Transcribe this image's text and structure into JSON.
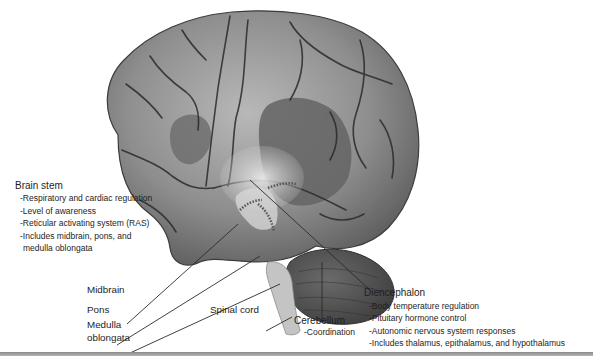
{
  "figure": {
    "colors": {
      "background": "#ffffff",
      "cortex_light": "#b5b5b5",
      "cortex_mid": "#8c8c8c",
      "cortex_dark": "#5a5a5a",
      "sulcus": "#2a2a2a",
      "leader_line": "#2b2b2b",
      "bottom_rule": "#9a9a9a"
    }
  },
  "labels": {
    "brain_stem": {
      "title": "Brain stem",
      "items": [
        "-Respiratory and cardiac regulation",
        "-Level of awareness",
        "-Reticular activating system (RAS)",
        "-Includes midbrain, pons, and",
        " medulla oblongata"
      ]
    },
    "midbrain": "Midbrain",
    "pons": "Pons",
    "medulla": {
      "line1": "Medulla",
      "line2": "oblongata"
    },
    "spinal_cord": "Spinal cord",
    "cerebellum": {
      "title": "Cerebellum",
      "item": "-Coordination"
    },
    "diencephalon": {
      "title": "Diencephalon",
      "items": [
        "-Body temperature regulation",
        "-Pituitary hormone control",
        "-Autonomic nervous system responses",
        "-Includes thalamus, epithalamus, and hypothalamus"
      ]
    }
  }
}
